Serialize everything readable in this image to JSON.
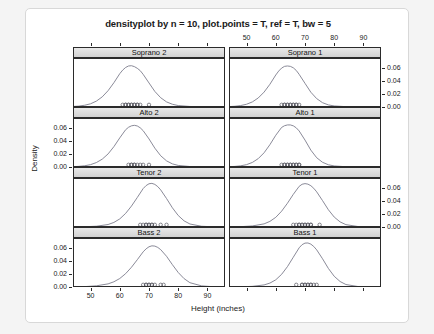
{
  "figure": {
    "title": "densityplot by n = 10, plot.points = T, ref = T, bw = 5",
    "xlabel": "Height (inches)",
    "ylabel": "Density"
  },
  "chart_data": {
    "type": "line",
    "title": "densityplot by n = 10, plot.points = T, ref = T, bw = 5",
    "xlabel": "Height (inches)",
    "ylabel": "Density",
    "grid": false,
    "legend": null,
    "layout": {
      "rows": 4,
      "cols": 2,
      "shared_x": true,
      "shared_y": true
    },
    "xlim": [
      44,
      96
    ],
    "ylim": [
      0,
      0.075
    ],
    "xticks": [
      50,
      60,
      70,
      80,
      90
    ],
    "xticklabels": [
      "50",
      "60",
      "70",
      "80",
      "90"
    ],
    "yticks": [
      0.0,
      0.02,
      0.04,
      0.06
    ],
    "yticklabels": [
      "0.00",
      "0.02",
      "0.04",
      "0.06"
    ],
    "bandwidth": 5,
    "n": 10,
    "panels": [
      {
        "strip": "Soprano 2",
        "row": 0,
        "col": 0,
        "peak_x": 64.5,
        "peak_y": 0.063,
        "mean": 64.9,
        "sd": 6.2,
        "points": [
          61,
          62,
          62,
          63,
          63,
          64,
          64,
          65,
          65,
          66,
          66,
          67,
          70
        ],
        "curve_x": [
          44,
          46,
          48,
          50,
          52,
          54,
          56,
          58,
          60,
          61,
          62,
          63,
          64,
          65,
          66,
          67,
          68,
          70,
          72,
          74,
          76,
          78,
          80,
          84,
          88,
          92,
          96
        ],
        "curve_y": [
          0.0008,
          0.0014,
          0.0027,
          0.0049,
          0.009,
          0.0155,
          0.025,
          0.0372,
          0.051,
          0.0565,
          0.0605,
          0.0628,
          0.0632,
          0.0618,
          0.0592,
          0.0556,
          0.05,
          0.0368,
          0.0238,
          0.0142,
          0.0078,
          0.0042,
          0.0022,
          0.0008,
          0.0003,
          0.0001,
          0.0
        ]
      },
      {
        "strip": "Soprano 1",
        "row": 0,
        "col": 1,
        "peak_x": 65.0,
        "peak_y": 0.062,
        "mean": 65.3,
        "sd": 5.8,
        "points": [
          62,
          63,
          63,
          64,
          64,
          65,
          65,
          66,
          66,
          67,
          67,
          68
        ],
        "curve_x": [
          44,
          46,
          48,
          50,
          52,
          54,
          56,
          58,
          60,
          61,
          62,
          63,
          64,
          65,
          66,
          67,
          68,
          70,
          72,
          74,
          76,
          78,
          80,
          84,
          88,
          92,
          96
        ],
        "curve_y": [
          0.0006,
          0.0011,
          0.0022,
          0.0042,
          0.0078,
          0.0138,
          0.0228,
          0.0348,
          0.049,
          0.055,
          0.0596,
          0.0622,
          0.0628,
          0.0622,
          0.06,
          0.056,
          0.05,
          0.0362,
          0.0226,
          0.0128,
          0.0066,
          0.0032,
          0.0016,
          0.0005,
          0.0002,
          0.0001,
          0.0
        ]
      },
      {
        "strip": "Alto 2",
        "row": 1,
        "col": 0,
        "peak_x": 65.5,
        "peak_y": 0.064,
        "mean": 65.8,
        "sd": 6.0,
        "points": [
          63,
          64,
          64,
          65,
          65,
          66,
          67,
          68,
          70
        ],
        "curve_x": [
          44,
          46,
          48,
          50,
          52,
          54,
          56,
          58,
          60,
          62,
          63,
          64,
          65,
          66,
          67,
          68,
          70,
          72,
          74,
          76,
          78,
          80,
          84,
          88,
          92,
          96
        ],
        "curve_y": [
          0.0005,
          0.001,
          0.0019,
          0.0036,
          0.0068,
          0.012,
          0.02,
          0.0312,
          0.0446,
          0.057,
          0.0608,
          0.063,
          0.0638,
          0.0628,
          0.06,
          0.0556,
          0.043,
          0.0288,
          0.0172,
          0.0094,
          0.0048,
          0.0024,
          0.0007,
          0.0002,
          0.0001,
          0.0
        ]
      },
      {
        "strip": "Alto 1",
        "row": 1,
        "col": 1,
        "peak_x": 65.0,
        "peak_y": 0.064,
        "mean": 65.2,
        "sd": 5.7,
        "points": [
          62,
          63,
          63,
          64,
          64,
          65,
          65,
          66,
          66,
          67,
          67,
          68,
          68
        ],
        "curve_x": [
          44,
          46,
          48,
          50,
          52,
          54,
          56,
          58,
          60,
          62,
          63,
          64,
          65,
          66,
          67,
          68,
          70,
          72,
          74,
          76,
          78,
          80,
          84,
          88,
          92,
          96
        ],
        "curve_y": [
          0.0005,
          0.0009,
          0.0018,
          0.0036,
          0.007,
          0.0128,
          0.0218,
          0.0342,
          0.0486,
          0.0606,
          0.0632,
          0.0644,
          0.0644,
          0.063,
          0.06,
          0.0552,
          0.0412,
          0.0258,
          0.0142,
          0.0072,
          0.0034,
          0.0016,
          0.0004,
          0.0001,
          0.0,
          0.0
        ]
      },
      {
        "strip": "Tenor 2",
        "row": 2,
        "col": 0,
        "peak_x": 70.5,
        "peak_y": 0.067,
        "mean": 70.6,
        "sd": 5.6,
        "points": [
          67,
          68,
          69,
          69,
          70,
          70,
          71,
          71,
          72,
          74,
          76
        ],
        "curve_x": [
          44,
          48,
          52,
          56,
          58,
          60,
          62,
          64,
          66,
          68,
          69,
          70,
          71,
          72,
          73,
          74,
          76,
          78,
          80,
          82,
          84,
          88,
          92,
          96
        ],
        "curve_y": [
          0.0001,
          0.0004,
          0.0012,
          0.0038,
          0.007,
          0.0124,
          0.0208,
          0.032,
          0.0452,
          0.0588,
          0.0634,
          0.0662,
          0.0668,
          0.0652,
          0.0618,
          0.0568,
          0.0436,
          0.0294,
          0.0176,
          0.0094,
          0.0046,
          0.0011,
          0.0003,
          0.0001
        ]
      },
      {
        "strip": "Tenor 1",
        "row": 2,
        "col": 1,
        "peak_x": 70.0,
        "peak_y": 0.066,
        "mean": 70.1,
        "sd": 5.5,
        "points": [
          66,
          67,
          68,
          68,
          69,
          69,
          70,
          70,
          71,
          71,
          72,
          72,
          75
        ],
        "curve_x": [
          44,
          48,
          52,
          56,
          58,
          60,
          62,
          64,
          66,
          68,
          69,
          70,
          71,
          72,
          73,
          74,
          76,
          78,
          80,
          82,
          84,
          88,
          92,
          96
        ],
        "curve_y": [
          0.0001,
          0.0005,
          0.0016,
          0.0048,
          0.0086,
          0.0148,
          0.0242,
          0.0364,
          0.05,
          0.0622,
          0.0654,
          0.0664,
          0.0656,
          0.0632,
          0.0592,
          0.0538,
          0.0404,
          0.0264,
          0.0152,
          0.0078,
          0.0036,
          0.0008,
          0.0002,
          0.0
        ]
      },
      {
        "strip": "Bass 2",
        "row": 3,
        "col": 0,
        "peak_x": 71.0,
        "peak_y": 0.063,
        "mean": 71.2,
        "sd": 6.0,
        "points": [
          68,
          69,
          69,
          70,
          70,
          71,
          71,
          72,
          74,
          75
        ],
        "curve_x": [
          44,
          48,
          52,
          56,
          58,
          60,
          62,
          64,
          66,
          68,
          69,
          70,
          71,
          72,
          73,
          74,
          76,
          78,
          80,
          82,
          84,
          88,
          92,
          96
        ],
        "curve_y": [
          0.0002,
          0.0006,
          0.0018,
          0.0048,
          0.008,
          0.013,
          0.0204,
          0.0302,
          0.0418,
          0.0538,
          0.0584,
          0.0616,
          0.063,
          0.0626,
          0.0606,
          0.0572,
          0.047,
          0.0342,
          0.0222,
          0.0128,
          0.0066,
          0.0017,
          0.0004,
          0.0001
        ]
      },
      {
        "strip": "Bass 1",
        "row": 3,
        "col": 1,
        "peak_x": 71.0,
        "peak_y": 0.067,
        "mean": 71.0,
        "sd": 5.4,
        "points": [
          67,
          69,
          69,
          70,
          70,
          71,
          71,
          72,
          72,
          73,
          74
        ],
        "curve_x": [
          44,
          48,
          52,
          56,
          58,
          60,
          62,
          64,
          66,
          68,
          69,
          70,
          71,
          72,
          73,
          74,
          76,
          78,
          80,
          82,
          84,
          88,
          92,
          96
        ],
        "curve_y": [
          0.0001,
          0.0003,
          0.001,
          0.0032,
          0.006,
          0.011,
          0.0194,
          0.0312,
          0.0456,
          0.06,
          0.0648,
          0.0672,
          0.0674,
          0.0656,
          0.062,
          0.0568,
          0.0432,
          0.0284,
          0.0164,
          0.0084,
          0.0038,
          0.0008,
          0.0002,
          0.0
        ]
      }
    ]
  }
}
